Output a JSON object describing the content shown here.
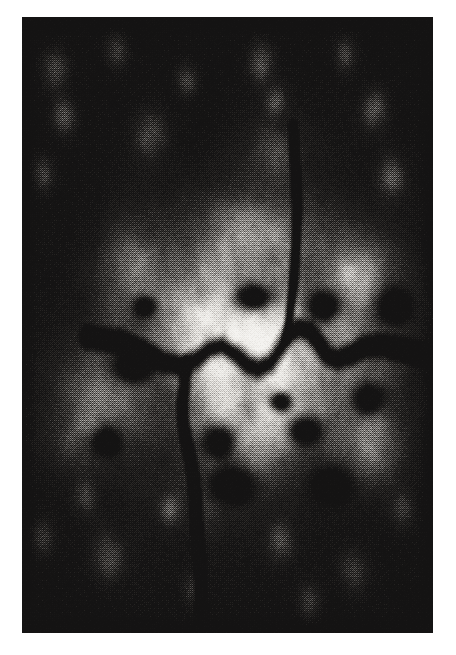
{
  "document": {
    "kind": "scanned-raster-figure",
    "background_color": "#ffffff",
    "caption": ""
  },
  "figure": {
    "name": "satellite-raster-image",
    "frame": {
      "x": 22,
      "y": 17,
      "width": 411,
      "height": 616
    },
    "palette": {
      "paper": "#ffffff",
      "background_dark": "#141313",
      "background_dark_2": "#1d1b1a",
      "mid_gray": "#8c8a87",
      "bright": "#e8e6e2",
      "white_speckle": "#f6f5f2",
      "river_dark": "#090909"
    },
    "render": {
      "seed": 20240517,
      "grid_cell": 2,
      "noise_scale_coarse": 0.013,
      "noise_scale_fine": 0.06,
      "dither_strength": 0.42
    }
  },
  "chart_data": {
    "type": "heatmap",
    "title": "",
    "subtitle": "",
    "xlabel": "",
    "ylabel": "",
    "grid": false,
    "legend": "none",
    "colormap": [
      "#141313",
      "#2a2826",
      "#5a5754",
      "#8c8a87",
      "#bdbab6",
      "#e8e6e2",
      "#f6f5f2"
    ],
    "value_range": [
      0,
      1
    ],
    "units": "built-up density (normalized)",
    "width_cells": 206,
    "height_cells": 308,
    "urban_cores": [
      {
        "name": "central-core",
        "cx": 0.6,
        "cy": 0.515,
        "rx": 0.175,
        "ry": 0.115,
        "amp": 1.0
      },
      {
        "name": "west-inner",
        "cx": 0.4,
        "cy": 0.485,
        "rx": 0.17,
        "ry": 0.115,
        "amp": 0.88
      },
      {
        "name": "north-inner",
        "cx": 0.55,
        "cy": 0.37,
        "rx": 0.2,
        "ry": 0.11,
        "amp": 0.82
      },
      {
        "name": "south-inner",
        "cx": 0.56,
        "cy": 0.64,
        "rx": 0.21,
        "ry": 0.125,
        "amp": 0.86
      },
      {
        "name": "east-outer",
        "cx": 0.8,
        "cy": 0.56,
        "rx": 0.17,
        "ry": 0.14,
        "amp": 0.7
      },
      {
        "name": "west-outer",
        "cx": 0.2,
        "cy": 0.6,
        "rx": 0.15,
        "ry": 0.12,
        "amp": 0.66
      },
      {
        "name": "northwest-suburb",
        "cx": 0.26,
        "cy": 0.4,
        "rx": 0.11,
        "ry": 0.085,
        "amp": 0.62
      },
      {
        "name": "northeast-suburb",
        "cx": 0.82,
        "cy": 0.4,
        "rx": 0.12,
        "ry": 0.085,
        "amp": 0.58
      },
      {
        "name": "southeast-suburb",
        "cx": 0.86,
        "cy": 0.7,
        "rx": 0.11,
        "ry": 0.08,
        "amp": 0.5
      },
      {
        "name": "southwest-suburb",
        "cx": 0.14,
        "cy": 0.69,
        "rx": 0.1,
        "ry": 0.07,
        "amp": 0.46
      },
      {
        "name": "far-north-cluster",
        "cx": 0.62,
        "cy": 0.215,
        "rx": 0.11,
        "ry": 0.06,
        "amp": 0.34
      },
      {
        "name": "south-corridor",
        "cx": 0.46,
        "cy": 0.79,
        "rx": 0.075,
        "ry": 0.075,
        "amp": 0.3
      }
    ],
    "halo": {
      "cx": 0.55,
      "cy": 0.545,
      "rx": 0.6,
      "ry": 0.46,
      "amp": 0.38
    },
    "rivers": [
      {
        "name": "main-river-east-west",
        "width": 0.013,
        "points": [
          [
            0.16,
            0.52
          ],
          [
            0.24,
            0.528
          ],
          [
            0.3,
            0.545
          ],
          [
            0.345,
            0.56
          ],
          [
            0.385,
            0.566
          ],
          [
            0.425,
            0.556
          ],
          [
            0.455,
            0.54
          ],
          [
            0.487,
            0.534
          ],
          [
            0.52,
            0.548
          ],
          [
            0.548,
            0.565
          ],
          [
            0.575,
            0.572
          ],
          [
            0.605,
            0.562
          ],
          [
            0.628,
            0.54
          ],
          [
            0.648,
            0.518
          ],
          [
            0.672,
            0.505
          ],
          [
            0.7,
            0.51
          ],
          [
            0.722,
            0.528
          ],
          [
            0.742,
            0.548
          ],
          [
            0.768,
            0.556
          ],
          [
            0.8,
            0.548
          ],
          [
            0.836,
            0.536
          ],
          [
            0.875,
            0.532
          ],
          [
            0.925,
            0.54
          ],
          [
            0.985,
            0.552
          ]
        ]
      },
      {
        "name": "south-tributary",
        "width": 0.01,
        "points": [
          [
            0.398,
            0.566
          ],
          [
            0.395,
            0.6
          ],
          [
            0.39,
            0.63
          ],
          [
            0.392,
            0.66
          ],
          [
            0.4,
            0.69
          ],
          [
            0.41,
            0.72
          ],
          [
            0.418,
            0.752
          ],
          [
            0.422,
            0.785
          ],
          [
            0.424,
            0.815
          ],
          [
            0.427,
            0.845
          ],
          [
            0.43,
            0.875
          ],
          [
            0.433,
            0.905
          ],
          [
            0.435,
            0.935
          ],
          [
            0.437,
            0.968
          ],
          [
            0.438,
            0.999
          ]
        ]
      },
      {
        "name": "north-tributary",
        "width": 0.008,
        "points": [
          [
            0.645,
            0.52
          ],
          [
            0.652,
            0.48
          ],
          [
            0.66,
            0.44
          ],
          [
            0.665,
            0.398
          ],
          [
            0.668,
            0.356
          ],
          [
            0.67,
            0.312
          ],
          [
            0.668,
            0.268
          ],
          [
            0.664,
            0.222
          ],
          [
            0.66,
            0.178
          ]
        ]
      }
    ],
    "dark_patches": [
      {
        "cx": 0.565,
        "cy": 0.455,
        "rx": 0.052,
        "ry": 0.024,
        "amp": 0.85
      },
      {
        "cx": 0.735,
        "cy": 0.47,
        "rx": 0.048,
        "ry": 0.028,
        "amp": 0.78
      },
      {
        "cx": 0.63,
        "cy": 0.625,
        "rx": 0.03,
        "ry": 0.017,
        "amp": 0.8
      },
      {
        "cx": 0.69,
        "cy": 0.672,
        "rx": 0.04,
        "ry": 0.022,
        "amp": 0.72
      },
      {
        "cx": 0.27,
        "cy": 0.568,
        "rx": 0.055,
        "ry": 0.026,
        "amp": 0.7
      },
      {
        "cx": 0.48,
        "cy": 0.69,
        "rx": 0.042,
        "ry": 0.03,
        "amp": 0.66
      },
      {
        "cx": 0.205,
        "cy": 0.69,
        "rx": 0.038,
        "ry": 0.026,
        "amp": 0.62
      },
      {
        "cx": 0.845,
        "cy": 0.62,
        "rx": 0.045,
        "ry": 0.03,
        "amp": 0.64
      },
      {
        "cx": 0.3,
        "cy": 0.47,
        "rx": 0.03,
        "ry": 0.018,
        "amp": 0.58
      },
      {
        "cx": 0.905,
        "cy": 0.47,
        "rx": 0.045,
        "ry": 0.032,
        "amp": 0.6
      },
      {
        "cx": 0.505,
        "cy": 0.76,
        "rx": 0.06,
        "ry": 0.032,
        "amp": 0.62
      },
      {
        "cx": 0.755,
        "cy": 0.76,
        "rx": 0.05,
        "ry": 0.03,
        "amp": 0.55
      }
    ],
    "speckle_clusters": [
      {
        "cx": 0.08,
        "cy": 0.085,
        "r": 0.035,
        "amp": 0.55
      },
      {
        "cx": 0.23,
        "cy": 0.055,
        "r": 0.03,
        "amp": 0.5
      },
      {
        "cx": 0.4,
        "cy": 0.1,
        "r": 0.028,
        "amp": 0.48
      },
      {
        "cx": 0.58,
        "cy": 0.07,
        "r": 0.034,
        "amp": 0.58
      },
      {
        "cx": 0.62,
        "cy": 0.135,
        "r": 0.026,
        "amp": 0.46
      },
      {
        "cx": 0.79,
        "cy": 0.06,
        "r": 0.03,
        "amp": 0.5
      },
      {
        "cx": 0.86,
        "cy": 0.15,
        "r": 0.034,
        "amp": 0.52
      },
      {
        "cx": 0.1,
        "cy": 0.16,
        "r": 0.032,
        "amp": 0.5
      },
      {
        "cx": 0.31,
        "cy": 0.185,
        "r": 0.04,
        "amp": 0.56
      },
      {
        "cx": 0.05,
        "cy": 0.255,
        "r": 0.03,
        "amp": 0.48
      },
      {
        "cx": 0.9,
        "cy": 0.26,
        "r": 0.036,
        "amp": 0.52
      },
      {
        "cx": 0.05,
        "cy": 0.845,
        "r": 0.03,
        "amp": 0.44
      },
      {
        "cx": 0.21,
        "cy": 0.88,
        "r": 0.042,
        "amp": 0.52
      },
      {
        "cx": 0.42,
        "cy": 0.925,
        "r": 0.03,
        "amp": 0.44
      },
      {
        "cx": 0.63,
        "cy": 0.855,
        "r": 0.034,
        "amp": 0.46
      },
      {
        "cx": 0.81,
        "cy": 0.9,
        "r": 0.036,
        "amp": 0.48
      },
      {
        "cx": 0.93,
        "cy": 0.8,
        "r": 0.03,
        "amp": 0.44
      },
      {
        "cx": 0.15,
        "cy": 0.78,
        "r": 0.028,
        "amp": 0.42
      },
      {
        "cx": 0.7,
        "cy": 0.95,
        "r": 0.03,
        "amp": 0.42
      },
      {
        "cx": 0.36,
        "cy": 0.8,
        "r": 0.026,
        "amp": 0.4
      }
    ]
  }
}
